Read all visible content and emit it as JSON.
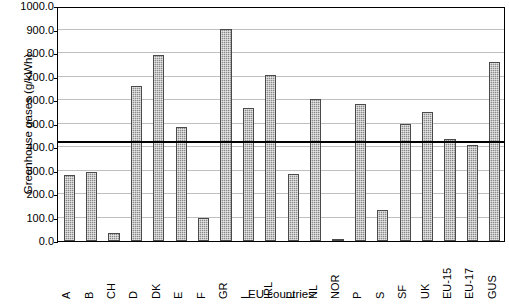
{
  "chart_data": {
    "type": "bar",
    "title": "",
    "xlabel": "EU countries",
    "ylabel": "Greenhouse gases (g/kWh)",
    "ylim": [
      0,
      1000
    ],
    "ytick_step": 100,
    "ytick_labels": [
      "1000.0",
      "900.0",
      "800.0",
      "700.0",
      "600.0",
      "500.0",
      "400.0",
      "300.0",
      "200.0",
      "100.0",
      "0.0"
    ],
    "grid": true,
    "legend": "none",
    "reference_line": {
      "value": 421,
      "style": "thick-solid-black",
      "label": ""
    },
    "categories": [
      "A",
      "B",
      "CH",
      "D",
      "DK",
      "E",
      "F",
      "GR",
      "I",
      "IRL",
      "L",
      "NL",
      "NOR",
      "P",
      "S",
      "SF",
      "UK",
      "EU-15",
      "EU-17",
      "GUS"
    ],
    "values": [
      281,
      294,
      34,
      658,
      790,
      487,
      96,
      902,
      568,
      705,
      286,
      605,
      10,
      585,
      130,
      498,
      548,
      432,
      407,
      760
    ],
    "series": [
      {
        "name": "Greenhouse gases",
        "values": [
          281,
          294,
          34,
          658,
          790,
          487,
          96,
          902,
          568,
          705,
          286,
          605,
          10,
          585,
          130,
          498,
          548,
          432,
          407,
          760
        ]
      }
    ],
    "bar_color": "#8a8a8a",
    "bar_edge_color": "#4a4a4a",
    "gridline_color": "#bfbfbf",
    "axis_color": "#000000"
  }
}
